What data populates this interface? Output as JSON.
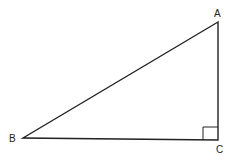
{
  "diagram": {
    "type": "right-triangle",
    "vertices": {
      "A": {
        "label": "A",
        "x": 218,
        "y": 22
      },
      "B": {
        "label": "B",
        "x": 23,
        "y": 138
      },
      "C": {
        "label": "C",
        "x": 218,
        "y": 140
      }
    },
    "right_angle_at": "C",
    "stroke_color": "#222222"
  }
}
